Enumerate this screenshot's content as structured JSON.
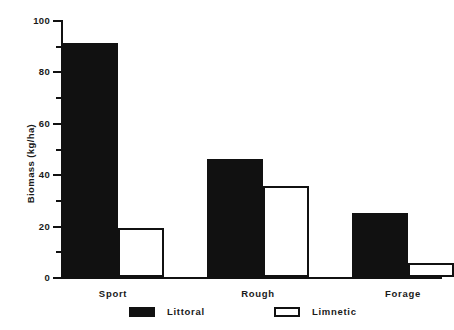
{
  "chart_data": {
    "type": "bar",
    "title": "",
    "subtitle": "",
    "xlabel": "",
    "ylabel": "Biomass (kg/ha)",
    "categories": [
      "Sport",
      "Rough",
      "Forage"
    ],
    "series": [
      {
        "name": "Littoral",
        "values": [
          91,
          46,
          25
        ],
        "color": "#111111",
        "fill": "solid"
      },
      {
        "name": "Limnetic",
        "values": [
          19,
          35.5,
          5.5
        ],
        "color": "#ffffff",
        "fill": "hollow"
      }
    ],
    "ylim": [
      0,
      100
    ],
    "ytick_major": [
      0,
      20,
      40,
      60,
      80,
      100
    ],
    "ytick_minor": [
      10,
      30,
      50,
      70,
      90
    ],
    "ytick_labels": [
      "0",
      "20",
      "40",
      "60",
      "80",
      "100"
    ],
    "grid": false,
    "legend_position": "bottom",
    "legend_entries": [
      "Littoral",
      "Limnetic"
    ]
  },
  "axes": {
    "y_title": "Biomass (kg/ha)",
    "y_labels": [
      "100",
      "80",
      "60",
      "40",
      "20",
      "0"
    ],
    "x_labels": [
      "Sport",
      "Rough",
      "Forage"
    ]
  },
  "legend": {
    "items": [
      {
        "label": "Littoral",
        "swatch": "filled-square-icon"
      },
      {
        "label": "Limnetic",
        "swatch": "hollow-square-icon"
      }
    ]
  },
  "colors": {
    "series_littoral": "#111111",
    "series_limnetic": "#ffffff",
    "axis": "#111111",
    "background": "#ffffff"
  }
}
